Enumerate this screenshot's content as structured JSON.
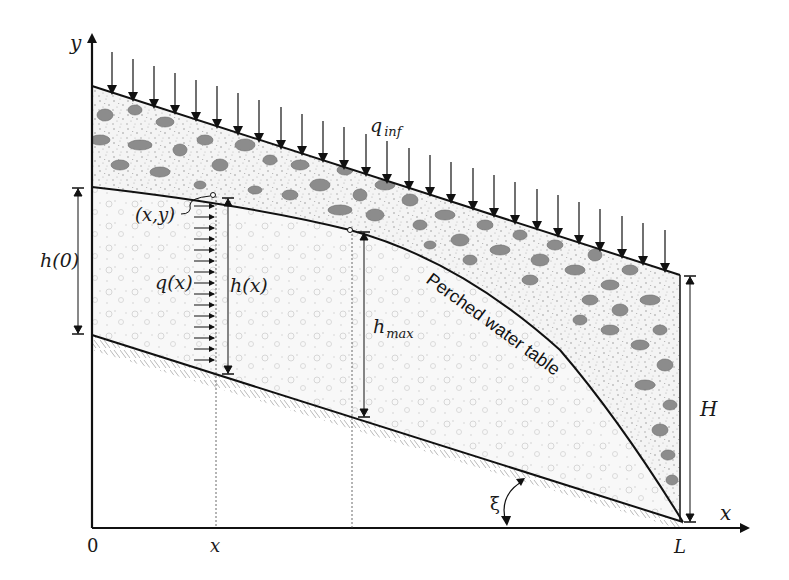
{
  "figure": {
    "type": "schematic"
  },
  "axes": {
    "y_label": "y",
    "x_label": "x",
    "origin_label": "0",
    "x_tick_label": "x",
    "end_label": "L"
  },
  "labels": {
    "infiltration": "q",
    "infiltration_sub": "inf",
    "water_table": "Perched water table",
    "point": "(x,y)",
    "h0": "h(0)",
    "qx": "q(x)",
    "hx": "h(x)",
    "hmax": "h",
    "hmax_sub": "max",
    "H": "H",
    "angle": "ξ"
  },
  "colors": {
    "line": "#111111",
    "upper_layer": "#f3f3f3",
    "lower_layer": "#f7f7f7",
    "stones": "#8a8a8a",
    "grains": "#b5b5b5",
    "hatch": "#777777"
  },
  "infiltration_arrow_count": 23,
  "lateral_flow_arrow_count": 15
}
